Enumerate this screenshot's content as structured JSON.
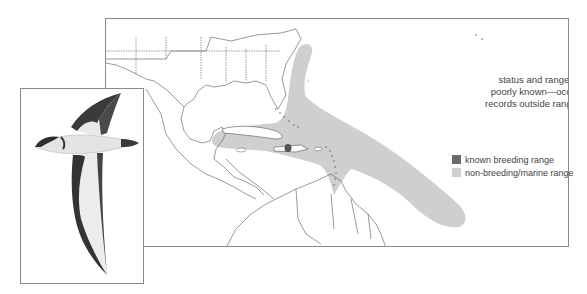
{
  "map": {
    "annotation": {
      "lines": [
        "status and range limits",
        "poorly known—occasional",
        "records outside range shown"
      ]
    },
    "legend": {
      "items": [
        {
          "label": "known breeding range",
          "color": "#6b6b6b"
        },
        {
          "label": "non-breeding/marine range",
          "color": "#cfcfcf"
        }
      ]
    },
    "colors": {
      "range_fill": "#cfcfcf",
      "breeding_fill": "#555555",
      "outline": "#555555",
      "frame": "#8a8a8a"
    }
  },
  "illustration": {
    "subject": "petrel-in-flight"
  }
}
